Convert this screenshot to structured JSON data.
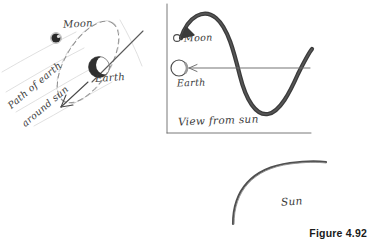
{
  "figure": {
    "caption": "Figure 4.92",
    "background_color": "#ffffff",
    "ink_color": "#3a3a3a",
    "dark_ink_color": "#2b2b2b"
  },
  "left_panel": {
    "name": "earth-moon-orbit-diagram",
    "labels": {
      "moon": "Moon",
      "earth": "Earth",
      "path_line1": "Path of earth",
      "path_line2": "around sun"
    },
    "elements": {
      "moon_body": "filled-dark-circle",
      "earth_body": "crescent-shaded-circle",
      "moon_orbit": "dashed-tilted-ellipse",
      "axis_line": "diagonal-straight-line",
      "path_arrow": "arrow-pointing-down-left"
    }
  },
  "right_panel": {
    "name": "view-from-sun-diagram",
    "labels": {
      "moon": "Moon",
      "earth": "Earth",
      "view_caption": "View from sun"
    },
    "elements": {
      "moon_body": "small-open-circle",
      "earth_body": "large-open-circle",
      "moon_wave": "thick-sine-wave-with-arrowhead",
      "earth_path": "thin-horizontal-line-with-left-arrowhead",
      "frame_left": "vertical-border-line",
      "frame_bottom": "horizontal-border-line"
    }
  },
  "sun_panel": {
    "name": "sun-limb-diagram",
    "labels": {
      "sun": "Sun"
    },
    "elements": {
      "sun_limb": "large-curved-arc"
    }
  }
}
